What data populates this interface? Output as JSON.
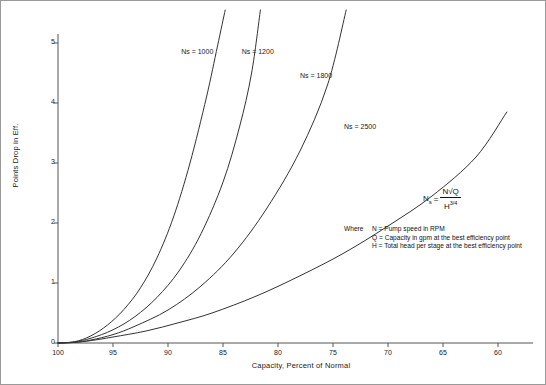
{
  "chart_data": {
    "type": "line",
    "title": "",
    "xlabel": "Capacity, Percent of Normal",
    "ylabel": "Points Drop in Eff.",
    "xlim": [
      100,
      60
    ],
    "ylim": [
      0,
      5.5
    ],
    "xticks": [
      100,
      95,
      90,
      85,
      80,
      75,
      70,
      65,
      60
    ],
    "yticks": [
      0,
      1,
      2,
      3,
      4,
      5
    ],
    "grid": false,
    "legend_position": "inline-curve-labels",
    "series": [
      {
        "name": "Ns = 1000",
        "label": "Ns = 1000",
        "label_x": 88.8,
        "label_y": 4.85,
        "x": [
          100,
          98.5,
          97,
          95.5,
          94,
          92.5,
          91,
          89.5,
          88,
          86.5,
          85.5,
          84.8
        ],
        "y": [
          0,
          0.02,
          0.12,
          0.3,
          0.56,
          0.92,
          1.42,
          2.1,
          3.0,
          4.1,
          4.95,
          5.55
        ]
      },
      {
        "name": "Ns = 1200",
        "label": "Ns = 1200",
        "label_x": 83.3,
        "label_y": 4.85,
        "x": [
          100,
          98.5,
          97,
          95,
          93,
          91,
          89,
          87,
          85,
          83.5,
          82.4,
          81.6
        ],
        "y": [
          0,
          0.02,
          0.08,
          0.22,
          0.44,
          0.76,
          1.2,
          1.82,
          2.68,
          3.6,
          4.5,
          5.55
        ]
      },
      {
        "name": "Ns = 1800",
        "label": "Ns = 1800",
        "label_x": 78.0,
        "label_y": 4.45,
        "x": [
          100,
          98.5,
          97,
          95,
          93,
          90,
          87,
          84,
          81,
          78,
          75.5,
          73.8
        ],
        "y": [
          0,
          0.01,
          0.05,
          0.14,
          0.28,
          0.55,
          0.95,
          1.5,
          2.25,
          3.2,
          4.3,
          5.55
        ]
      },
      {
        "name": "Ns = 2500",
        "label": "Ns = 2500",
        "label_x": 74.0,
        "label_y": 3.6,
        "x": [
          100,
          98.5,
          97,
          95,
          92,
          89,
          86,
          82,
          78,
          74,
          70,
          66,
          62,
          59.2
        ],
        "y": [
          0,
          0.01,
          0.04,
          0.1,
          0.2,
          0.34,
          0.5,
          0.78,
          1.12,
          1.5,
          1.95,
          2.45,
          3.1,
          3.85
        ]
      }
    ],
    "annotations": {
      "formula_lhs": "N",
      "formula_lhs_sub": "s",
      "formula_eq": "=",
      "formula_numerator": "N√Q",
      "formula_denominator_base": "H",
      "formula_denominator_exp": "3/4",
      "where_lead": "Where",
      "definitions": [
        "N = Pump speed in RPM",
        "Q = Capacity in gpm at the best efficiency point",
        "H = Total head per stage at the best efficiency point"
      ]
    },
    "colors": {
      "curve": "#333333",
      "axis": "#555555",
      "text": "#1a1a1a",
      "frame": "#9a9a9a",
      "background": "#ffffff"
    }
  }
}
